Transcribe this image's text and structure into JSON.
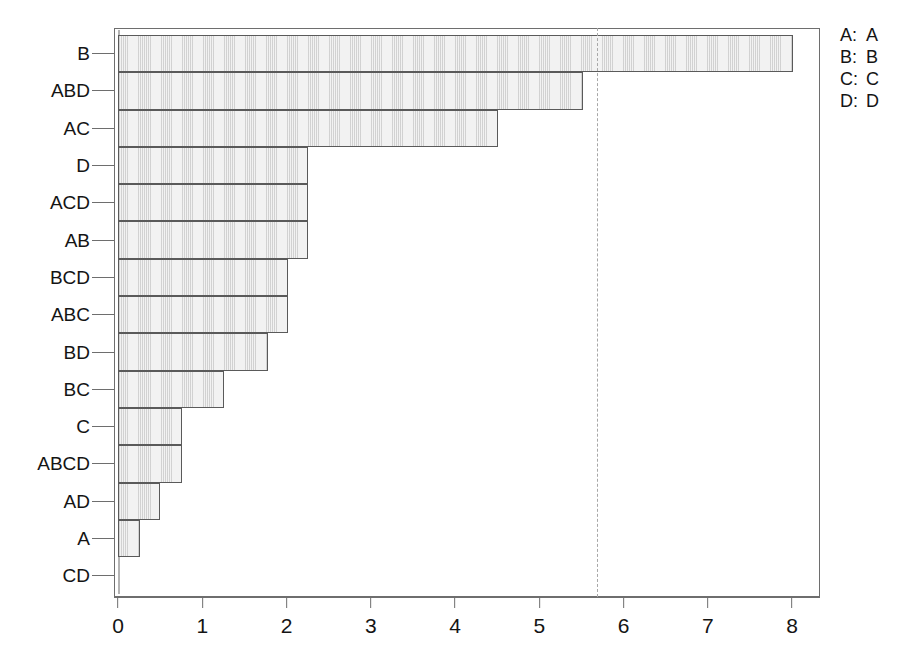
{
  "chart_data": {
    "type": "bar",
    "orientation": "horizontal",
    "title": "",
    "xlabel": "",
    "ylabel": "",
    "xlim": [
      0,
      8.38
    ],
    "xticks": [
      "0",
      "1",
      "2",
      "3",
      "4",
      "5",
      "6",
      "7",
      "8"
    ],
    "xtick_values": [
      0,
      1,
      2,
      3,
      4,
      5,
      6,
      7,
      8
    ],
    "grid": false,
    "categories": [
      "B",
      "ABD",
      "AC",
      "D",
      "ACD",
      "AB",
      "BCD",
      "ABC",
      "BD",
      "BC",
      "C",
      "ABCD",
      "AD",
      "A",
      "CD"
    ],
    "values": [
      8.01,
      5.52,
      4.51,
      2.26,
      2.26,
      2.26,
      2.02,
      2.02,
      1.78,
      1.26,
      0.76,
      0.76,
      0.5,
      0.26,
      0
    ],
    "reference_line": {
      "value": 5.69,
      "style": "dashed",
      "color": "#a8a8a8"
    },
    "bar_fill": "#f2f2f2",
    "bar_edge": "#5a5a5a",
    "legend_position": "right"
  },
  "legend": {
    "entries": [
      {
        "key": "A:",
        "value": "A"
      },
      {
        "key": "B:",
        "value": "B"
      },
      {
        "key": "C:",
        "value": "C"
      },
      {
        "key": "D:",
        "value": "D"
      }
    ]
  }
}
